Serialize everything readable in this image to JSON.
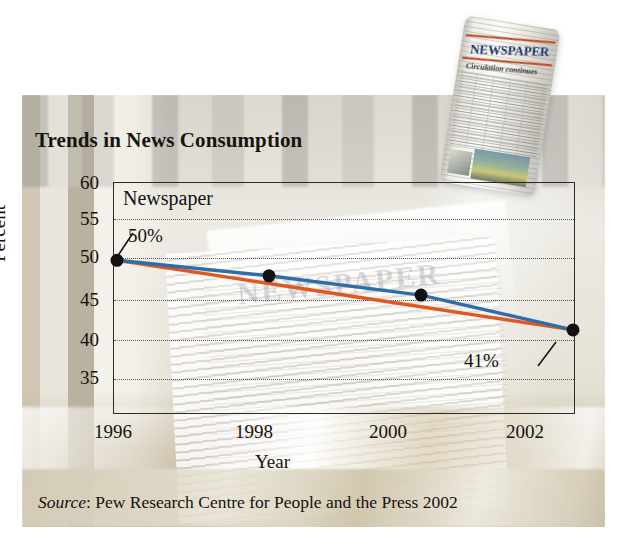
{
  "figure": {
    "title": "Trends in News Consumption",
    "source_prefix": "Source",
    "source_text": ": Pew Research Centre for People and the Press 2002",
    "masthead": "NEWSPAPER",
    "masthead_headline": "Circulation continues",
    "ghost_masthead": "NEWSPAPER"
  },
  "colors": {
    "series_line": "#2E6DA8",
    "trend_line": "#E0581E",
    "marker": "#111111",
    "frame": "#2B2B2B",
    "text": "#15120F"
  },
  "chart_data": {
    "type": "line",
    "title": "Trends in News Consumption",
    "xlabel": "Year",
    "ylabel": "Percent",
    "xlim": [
      1996,
      2002
    ],
    "ylim": [
      30,
      60
    ],
    "xticks": [
      "1996",
      "1998",
      "2000",
      "2002"
    ],
    "yticks": [
      "60",
      "55",
      "50",
      "45",
      "40",
      "35"
    ],
    "grid": "horizontal dotted gridlines at 55, 50, 45, 40, 35",
    "legend": "inline label",
    "annotations": [
      {
        "text": "Newspaper",
        "kind": "series-label"
      },
      {
        "text": "50%",
        "kind": "point-callout",
        "points_to": {
          "x": 1996,
          "y": 50
        }
      },
      {
        "text": "41%",
        "kind": "point-callout",
        "points_to": {
          "x": 2002,
          "y": 41
        }
      }
    ],
    "x": [
      1996,
      1998,
      2000,
      2002
    ],
    "series": [
      {
        "name": "Newspaper",
        "color": "#2E6DA8",
        "markers": true,
        "values": [
          50,
          48,
          45.5,
          41
        ]
      },
      {
        "name": "Trend",
        "color": "#E0581E",
        "markers": false,
        "values": [
          50,
          47,
          44,
          41
        ]
      }
    ]
  }
}
